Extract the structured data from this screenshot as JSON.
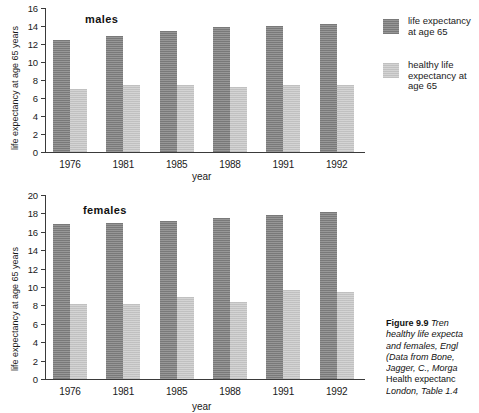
{
  "figure": {
    "caption_lines": [
      {
        "bold": "Figure 9.9",
        "italic": "  Tren"
      },
      {
        "bold": "",
        "italic": "healthy life expecta"
      },
      {
        "bold": "",
        "italic": "and females, Engl"
      },
      {
        "bold": "",
        "italic": "(Data from Bone,"
      },
      {
        "bold": "",
        "italic": "Jagger, C., Morga"
      },
      {
        "bold": "",
        "italic": "",
        "roman": "Health expectanc"
      },
      {
        "bold": "",
        "italic": "London, Table 1.4"
      }
    ]
  },
  "legend": {
    "position": "right",
    "items": [
      {
        "label": "life expectancy at age 65",
        "color": "#8b8b8b",
        "swatch_name": "legend-swatch-life-expectancy"
      },
      {
        "label": "healthy  life expectancy at age 65",
        "color": "#cfcfcf",
        "swatch_name": "legend-swatch-healthy-life-expectancy"
      }
    ]
  },
  "chart_data": [
    {
      "type": "bar",
      "title": "males",
      "xlabel": "year",
      "ylabel": "life expectancy at age 65 years",
      "categories": [
        "1976",
        "1981",
        "1985",
        "1988",
        "1991",
        "1992"
      ],
      "ylim": [
        0,
        16
      ],
      "yticks": [
        0,
        2,
        4,
        6,
        8,
        10,
        12,
        14,
        16
      ],
      "grid": false,
      "series": [
        {
          "name": "life expectancy at age 65",
          "color": "#8b8b8b",
          "values": [
            12.4,
            12.9,
            13.4,
            13.9,
            14.0,
            14.2
          ]
        },
        {
          "name": "healthy life expectancy at age 65",
          "color": "#cfcfcf",
          "values": [
            7.0,
            7.5,
            7.5,
            7.2,
            7.5,
            7.5
          ]
        }
      ]
    },
    {
      "type": "bar",
      "title": "females",
      "xlabel": "year",
      "ylabel": "life expectancy at age 65 years",
      "categories": [
        "1976",
        "1981",
        "1985",
        "1988",
        "1991",
        "1992"
      ],
      "ylim": [
        0,
        20
      ],
      "yticks": [
        0,
        2,
        4,
        6,
        8,
        10,
        12,
        14,
        16,
        18,
        20
      ],
      "grid": false,
      "series": [
        {
          "name": "life expectancy at age 65",
          "color": "#8b8b8b",
          "values": [
            16.8,
            17.0,
            17.2,
            17.5,
            17.8,
            18.1
          ]
        },
        {
          "name": "healthy life expectancy at age 65",
          "color": "#cfcfcf",
          "values": [
            8.2,
            8.1,
            8.9,
            8.4,
            9.7,
            9.5
          ]
        }
      ]
    }
  ]
}
